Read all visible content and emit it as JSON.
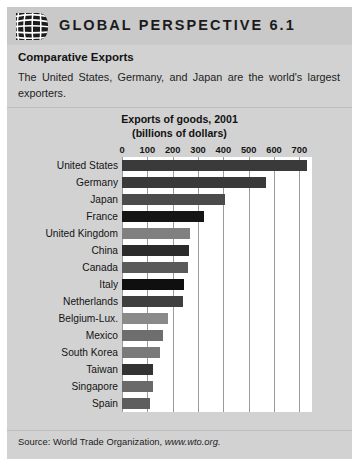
{
  "header": {
    "title": "GLOBAL PERSPECTIVE 6.1",
    "logo_icon": "globe-grid-icon"
  },
  "intro": {
    "subtitle": "Comparative Exports",
    "body": "The United States, Germany, and Japan are the world's largest exporters."
  },
  "chart_title_line1": "Exports of goods, 2001",
  "chart_title_line2": "(billions of dollars)",
  "source": {
    "prefix": "Source: World Trade Organization, ",
    "url": "www.wto.org."
  },
  "chart_data": {
    "type": "bar",
    "orientation": "horizontal",
    "title": "Exports of goods, 2001 (billions of dollars)",
    "xlabel": "billions of dollars",
    "ylabel": "",
    "xlim": [
      0,
      750
    ],
    "ticks": [
      0,
      100,
      200,
      300,
      400,
      500,
      600,
      700
    ],
    "grid": true,
    "legend": "none",
    "categories": [
      "United States",
      "Germany",
      "Japan",
      "France",
      "United Kingdom",
      "China",
      "Canada",
      "Italy",
      "Netherlands",
      "Belgium-Lux.",
      "Mexico",
      "South Korea",
      "Taiwan",
      "Singapore",
      "Spain"
    ],
    "values": [
      730,
      570,
      405,
      325,
      270,
      266,
      260,
      245,
      240,
      180,
      160,
      150,
      122,
      122,
      110
    ],
    "bar_colors": [
      "#3a3a3a",
      "#3a3a3a",
      "#4b4b4b",
      "#151515",
      "#808080",
      "#2b2b2b",
      "#5a5a5a",
      "#0f0f0f",
      "#3f3f3f",
      "#8a8a8a",
      "#6e6e6e",
      "#7a7a7a",
      "#333333",
      "#6a6a6a",
      "#5e5e5e"
    ]
  },
  "colors": {
    "panel_bg": "#d2d2d2",
    "header_bg": "#c9c9c9",
    "plot_bg": "#ffffff",
    "gridline": "#9b9b9b"
  }
}
